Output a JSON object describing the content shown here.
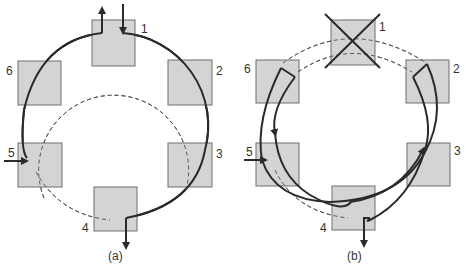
{
  "panels": [
    {
      "id": "a",
      "caption": "(a)",
      "nodes": [
        {
          "label": "1",
          "state": "active"
        },
        {
          "label": "2",
          "state": "active"
        },
        {
          "label": "3",
          "state": "active"
        },
        {
          "label": "4",
          "state": "active"
        },
        {
          "label": "5",
          "state": "active"
        },
        {
          "label": "6",
          "state": "active"
        }
      ],
      "description": "Dual counter-rotating ring, normal operation: primary ring (solid) and secondary ring (dashed)"
    },
    {
      "id": "b",
      "caption": "(b)",
      "nodes": [
        {
          "label": "1",
          "state": "failed"
        },
        {
          "label": "2",
          "state": "wrapped"
        },
        {
          "label": "3",
          "state": "active"
        },
        {
          "label": "4",
          "state": "active"
        },
        {
          "label": "5",
          "state": "active"
        },
        {
          "label": "6",
          "state": "wrapped"
        }
      ],
      "description": "Node 1 failed; stations 2 and 6 wrap primary and secondary rings into a single loop"
    }
  ],
  "colors": {
    "node_fill": "#d4d4d4",
    "node_stroke": "#6e6e6e",
    "line": "#2a2a2a",
    "dashed": "#555555"
  }
}
